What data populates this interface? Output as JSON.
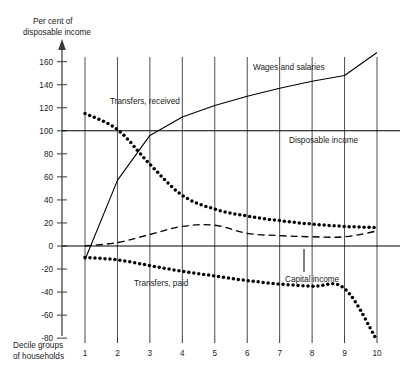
{
  "chart_data": {
    "type": "line",
    "title": "",
    "ylabel_line1": "Per cent of",
    "ylabel_line2": "disposable income",
    "xlabel_line1": "Decile groups",
    "xlabel_line2": "of households",
    "categories": [
      "1",
      "2",
      "3",
      "4",
      "5",
      "6",
      "7",
      "8",
      "9",
      "10"
    ],
    "x": [
      1,
      2,
      3,
      4,
      5,
      6,
      7,
      8,
      9,
      10
    ],
    "ylim": [
      -90,
      170
    ],
    "xlim": [
      0.6,
      10.4
    ],
    "yticks": [
      160,
      140,
      120,
      100,
      80,
      60,
      40,
      20,
      0,
      -20,
      -40,
      -60,
      -80
    ],
    "ytick_labels": [
      "160",
      "140",
      "120",
      "100",
      "80",
      "60",
      "40",
      "20",
      "0",
      "-20",
      "-40",
      "-60",
      "-80"
    ],
    "grid": "vertical-only",
    "legend": "inline-annotations",
    "reference_lines": [
      {
        "name": "disposable-income",
        "value": 100,
        "label": "Disposable income",
        "style": "solid"
      },
      {
        "name": "zero-line",
        "value": 0,
        "label": "",
        "style": "solid"
      }
    ],
    "series": [
      {
        "name": "Wages and salaries",
        "label": "Wages and salaries",
        "style": "solid",
        "values": [
          -12,
          57,
          96,
          112,
          122,
          130,
          137,
          143,
          148,
          168
        ]
      },
      {
        "name": "Transfers, received",
        "label": "Transfers, received",
        "style": "dotted",
        "values": [
          115,
          101,
          71,
          44,
          32,
          26,
          22,
          19,
          17,
          16
        ]
      },
      {
        "name": "Capital income",
        "label": "Capital income",
        "style": "dashed",
        "values": [
          0,
          3,
          10,
          17,
          18,
          11,
          9,
          8,
          8,
          13
        ]
      },
      {
        "name": "Transfers, paid",
        "label": "Transfers, paid",
        "style": "dotted",
        "values": [
          -10,
          -12,
          -17,
          -22,
          -26,
          -30,
          -33,
          -35,
          -37,
          -82
        ]
      }
    ],
    "annotations": [
      {
        "name": "wages-and-salaries-label",
        "text": "Wages and salaries",
        "x_px": 253,
        "y_px": 70
      },
      {
        "name": "transfers-received-label",
        "text": "Transfers, received",
        "x_px": 110,
        "y_px": 104
      },
      {
        "name": "disposable-income-label",
        "text": "Disposable income",
        "x_px": 289,
        "y_px": 143
      },
      {
        "name": "capital-income-label",
        "text": "Capital income",
        "x_px": 285,
        "y_px": 282
      },
      {
        "name": "transfers-paid-label",
        "text": "Transfers, paid",
        "x_px": 134,
        "y_px": 286
      }
    ],
    "colors": {
      "line": "#000000",
      "gridline": "#3a3a3a",
      "axis": "#3a3a3a",
      "background": "#ffffff",
      "text": "#1a1a1a"
    }
  }
}
